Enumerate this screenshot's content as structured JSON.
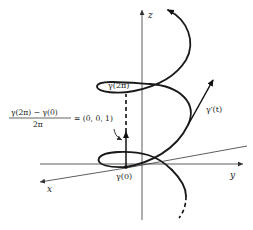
{
  "diagram": {
    "axes": {
      "x_label": "x",
      "y_label": "y",
      "z_label": "z"
    },
    "labels": {
      "gamma_0": "γ(0)",
      "gamma_2pi": "γ(2π)",
      "gamma_prime": "γ′(t)",
      "fraction_numerator": "γ(2π) − γ(0)",
      "fraction_denominator": "2π",
      "equals_value": "= (0, 0, 1)"
    }
  }
}
